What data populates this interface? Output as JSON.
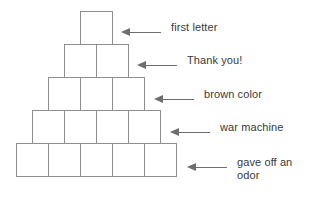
{
  "diagram": {
    "line_color": "#8e8e8e",
    "arrow_color": "#6e6e6e",
    "text_color": "#3a3a3a",
    "background": "#ffffff"
  },
  "pyramid": {
    "rows": [
      {
        "index": 1,
        "block_count": 1,
        "blocks": [
          "",
          ""
        ]
      },
      {
        "index": 2,
        "block_count": 2
      },
      {
        "index": 3,
        "block_count": 3
      },
      {
        "index": 4,
        "block_count": 4
      },
      {
        "index": 5,
        "block_count": 5
      }
    ]
  },
  "clues": [
    {
      "row": 1,
      "arrow": "left-arrow",
      "text": "first letter"
    },
    {
      "row": 2,
      "arrow": "left-arrow",
      "text": "Thank you!"
    },
    {
      "row": 3,
      "arrow": "left-arrow",
      "text": "brown color"
    },
    {
      "row": 4,
      "arrow": "left-arrow",
      "text": "war machine"
    },
    {
      "row": 5,
      "arrow": "left-arrow",
      "text": "gave off an\nodor"
    }
  ]
}
